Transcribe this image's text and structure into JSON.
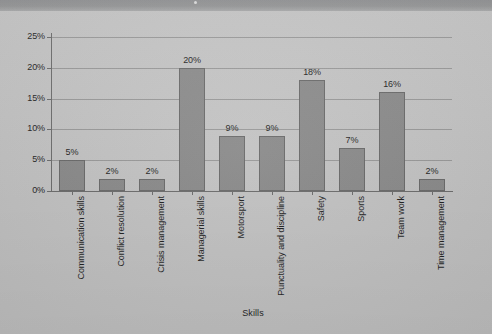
{
  "chart_data": {
    "type": "bar",
    "title": "",
    "xlabel": "Skills",
    "ylabel": "",
    "categories": [
      "Communication skills",
      "Conflict resolution",
      "Crisis management",
      "Managerial skills",
      "Motorsport",
      "Punctuality and discipline",
      "Safety",
      "Sports",
      "Team work",
      "Time management"
    ],
    "values": [
      5,
      2,
      2,
      20,
      9,
      9,
      18,
      7,
      16,
      2
    ],
    "value_labels": [
      "5%",
      "2%",
      "2%",
      "20%",
      "9%",
      "9%",
      "18%",
      "7%",
      "16%",
      "2%"
    ],
    "ylim": [
      0,
      25
    ],
    "ytick_values": [
      0,
      5,
      10,
      15,
      20,
      25
    ],
    "ytick_labels": [
      "0%",
      "5%",
      "10%",
      "15%",
      "20%",
      "25%"
    ],
    "grid": true,
    "legend": null,
    "legend_position": "none",
    "bar_color": "#8c8c8c",
    "bar_edge_color": "#6a6a6a",
    "gridline_color": "#9a9a9a",
    "axis_color": "#6d6d6d",
    "background_color": "#c6c6c6",
    "text_color": "#1f1f1f"
  },
  "page": {
    "top_band_color": "#949596"
  }
}
